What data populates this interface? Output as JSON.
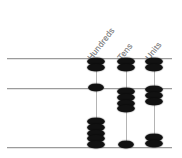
{
  "diagram": {
    "type": "abacus",
    "columns": [
      {
        "id": "hundreds",
        "label": "Hundreds",
        "x": 96
      },
      {
        "id": "tens",
        "label": "Tens",
        "x": 126
      },
      {
        "id": "units",
        "label": "Units",
        "x": 154
      }
    ],
    "rails": [
      {
        "id": "rail-top",
        "y": 58,
        "x1": 7,
        "x2": 172
      },
      {
        "id": "rail-middle",
        "y": 88,
        "x1": 7,
        "x2": 172
      },
      {
        "id": "rail-bottom",
        "y": 147,
        "x1": 7,
        "x2": 172
      }
    ],
    "bead_counts": {
      "rail_top": {
        "hundreds": 2,
        "tens": 2,
        "units": 2
      },
      "rail_middle": {
        "hundreds": 1,
        "tens": 4,
        "units": 3
      },
      "rail_bottom": {
        "hundreds": 5,
        "tens": 1,
        "units": 2
      }
    },
    "rows": [
      {
        "id": "row-1",
        "rail": "rail-top",
        "beads": [
          {
            "column": "hundreds",
            "count": 2
          },
          {
            "column": "tens",
            "count": 2
          },
          {
            "column": "units",
            "count": 2
          }
        ]
      },
      {
        "id": "row-2",
        "rail": "rail-middle",
        "beads": [
          {
            "column": "hundreds",
            "count": 1
          },
          {
            "column": "tens",
            "count": 4
          },
          {
            "column": "units",
            "count": 3
          }
        ]
      },
      {
        "id": "row-3",
        "rail": "rail-bottom",
        "beads": [
          {
            "column": "hundreds",
            "count": 5
          },
          {
            "column": "tens",
            "count": 1
          },
          {
            "column": "units",
            "count": 2
          }
        ]
      }
    ],
    "colors": {
      "bead": "#111111",
      "rail": "#9b9b9b",
      "rod": "#b4b4b4",
      "label": "#8a8a8a",
      "background": "#ffffff"
    }
  }
}
